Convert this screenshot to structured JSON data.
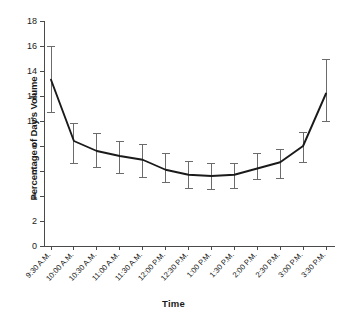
{
  "figure": {
    "top_caption": "",
    "background_color": "#ffffff",
    "line_color": "#1a1a1a",
    "errorbar_color": "#6b6b6b",
    "axis_color": "#4a4a4a"
  },
  "axis": {
    "ylabel": "Percentage of Day's Volume",
    "xlabel": "Time",
    "yticks": [
      "0",
      "2",
      "4",
      "6",
      "8",
      "10",
      "12",
      "14",
      "16",
      "18"
    ]
  },
  "chart_data": {
    "type": "line",
    "title": "",
    "xlabel": "Time",
    "ylabel": "Percentage of Day's Volume",
    "ylim": [
      0,
      18
    ],
    "ytick_step": 2,
    "grid": false,
    "legend": false,
    "errorbars": "vertical capped (whisker) bars at each point",
    "categories": [
      "9:30 A.M.",
      "10:00 A.M.",
      "10:30 A.M.",
      "11:00 A.M.",
      "11:30 A.M.",
      "12:00 P.M.",
      "12:30 P.M.",
      "1:00 P.M.",
      "1:30 P.M.",
      "2:00 P.M.",
      "2:30 P.M.",
      "3:00 P.M.",
      "3:30 P.M."
    ],
    "values": [
      13.3,
      8.4,
      7.6,
      7.2,
      6.9,
      6.1,
      5.7,
      5.6,
      5.7,
      6.2,
      6.7,
      8.0,
      12.2
    ],
    "error_low": [
      10.7,
      6.6,
      6.3,
      5.8,
      5.5,
      5.1,
      4.6,
      4.5,
      4.6,
      5.3,
      5.4,
      6.7,
      10.0
    ],
    "error_high": [
      16.0,
      9.8,
      9.0,
      8.4,
      8.1,
      7.4,
      6.8,
      6.6,
      6.6,
      7.4,
      7.7,
      9.1,
      14.9
    ]
  }
}
